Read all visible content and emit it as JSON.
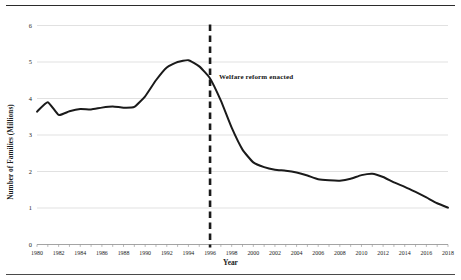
{
  "figure": {
    "background": "#ffffff",
    "rule_color": "#2b2b2b",
    "has_top_rule": true,
    "has_bottom_rule": true
  },
  "annotations": [
    {
      "name": "welfare-reform-annotation",
      "text": "Welfare reform enacted",
      "x_year": 1996,
      "y_value": 4.55,
      "marker": "dashed-vertical-line"
    }
  ],
  "chart_data": {
    "type": "line",
    "title": "",
    "xlabel": "Year",
    "ylabel": "Number of Families (Millions)",
    "xlim": [
      1980,
      2018
    ],
    "ylim": [
      0,
      6
    ],
    "yticks": [
      0,
      1,
      2,
      3,
      4,
      5,
      6
    ],
    "ytick_labels": [
      "0",
      "1",
      "2",
      "3",
      "4",
      "5",
      "6"
    ],
    "xticks": [
      1980,
      1982,
      1984,
      1986,
      1988,
      1990,
      1992,
      1994,
      1996,
      1998,
      2000,
      2002,
      2004,
      2006,
      2008,
      2010,
      2012,
      2014,
      2016,
      2018
    ],
    "xtick_labels": [
      "1980",
      "1982",
      "1984",
      "1986",
      "1988",
      "1990",
      "1992",
      "1994",
      "1996",
      "1998",
      "2000",
      "2002",
      "2004",
      "2006",
      "2008",
      "2010",
      "2012",
      "2014",
      "2016",
      "2018"
    ],
    "grid": "horizontal",
    "grid_color": "#d9d9d9",
    "legend": null,
    "line_color": "#1a1a1a",
    "line_width": 2.0,
    "x": [
      1980,
      1981,
      1982,
      1983,
      1984,
      1985,
      1986,
      1987,
      1988,
      1989,
      1990,
      1991,
      1992,
      1993,
      1994,
      1995,
      1996,
      1997,
      1998,
      1999,
      2000,
      2001,
      2002,
      2003,
      2004,
      2005,
      2006,
      2007,
      2008,
      2009,
      2010,
      2011,
      2012,
      2013,
      2014,
      2015,
      2016,
      2017,
      2018
    ],
    "values": [
      3.64,
      3.9,
      3.55,
      3.65,
      3.71,
      3.7,
      3.75,
      3.78,
      3.75,
      3.77,
      4.06,
      4.5,
      4.85,
      5.0,
      5.05,
      4.88,
      4.55,
      3.94,
      3.2,
      2.6,
      2.25,
      2.12,
      2.05,
      2.02,
      1.97,
      1.89,
      1.79,
      1.76,
      1.75,
      1.8,
      1.9,
      1.94,
      1.85,
      1.7,
      1.58,
      1.44,
      1.29,
      1.13,
      1.01
    ],
    "annotation_lines": [
      {
        "type": "vline",
        "x": 1996,
        "style": "dashed",
        "color": "#1a1a1a",
        "width": 2.6
      }
    ]
  }
}
